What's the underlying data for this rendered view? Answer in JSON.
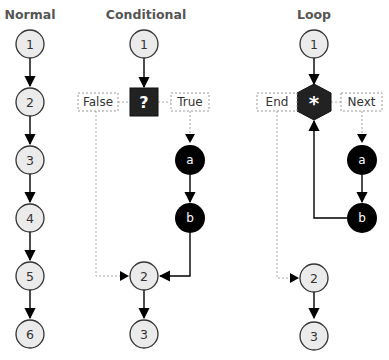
{
  "columns": {
    "normal": {
      "title": "Normal",
      "nodes": [
        "1",
        "2",
        "3",
        "4",
        "5",
        "6"
      ]
    },
    "conditional": {
      "title": "Conditional",
      "start": "1",
      "decision_symbol": "?",
      "false_label": "False",
      "true_label": "True",
      "branch_nodes": [
        "a",
        "b"
      ],
      "merge_nodes": [
        "2",
        "3"
      ]
    },
    "loop": {
      "title": "Loop",
      "start": "1",
      "loop_symbol": "*",
      "end_label": "End",
      "next_label": "Next",
      "body_nodes": [
        "a",
        "b"
      ],
      "after_nodes": [
        "2",
        "3"
      ]
    }
  },
  "colors": {
    "light_node_fill": "#ebebeb",
    "dark_node_fill": "#000000",
    "decision_fill": "#222222",
    "title_text": "#555555",
    "dashed_line": "#aaaaaa"
  }
}
